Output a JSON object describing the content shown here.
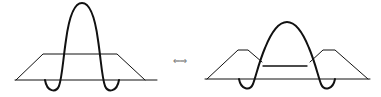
{
  "diagram": {
    "arrow_symbol": "⇐⇒",
    "colors": {
      "stroke": "#111111",
      "background": "#ffffff"
    },
    "figures": [
      {
        "id": "left",
        "label": "Tall narrow pulse over flat-top trapezoid"
      },
      {
        "id": "right",
        "label": "Broader lower pulse over double-shoulder trapezoid"
      }
    ]
  }
}
